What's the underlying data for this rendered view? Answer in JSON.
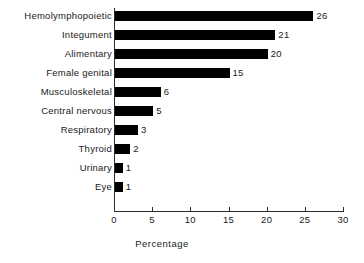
{
  "chart_data": {
    "type": "bar",
    "orientation": "horizontal",
    "title": "",
    "xlabel": "Percentage",
    "ylabel": "",
    "xlim": [
      0,
      30
    ],
    "xticks": [
      0,
      5,
      10,
      15,
      20,
      25,
      30
    ],
    "xtick_labels": [
      "0",
      "5",
      "10",
      "15",
      "20",
      "25",
      "30"
    ],
    "grid": false,
    "legend": null,
    "bar_color": "#000000",
    "background_color": "#ffffff",
    "categories": [
      "Hemolymphopoietic",
      "Integument",
      "Alimentary",
      "Female genital",
      "Musculoskeletal",
      "Central nervous",
      "Respiratory",
      "Thyroid",
      "Urinary",
      "Eye"
    ],
    "values": [
      26,
      21,
      20,
      15,
      6,
      5,
      3,
      2,
      1,
      1
    ],
    "value_labels": [
      "26",
      "21",
      "20",
      "15",
      "6",
      "5",
      "3",
      "2",
      "1",
      "1"
    ]
  }
}
